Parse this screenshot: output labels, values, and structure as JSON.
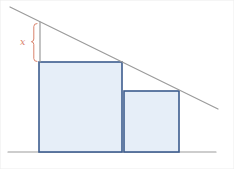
{
  "diagram": {
    "label_x": "x",
    "colors": {
      "background": "#ffffff",
      "frame": "#ececec",
      "line_gray": "#9b9b9b",
      "square_stroke": "#3d5c8e",
      "square_fill": "#e6eef8",
      "accent_orange": "#d9826b"
    },
    "geometry": {
      "canvas": {
        "width": 234,
        "height": 169
      },
      "hypotenuse": {
        "x1": 10,
        "y1": 7,
        "x2": 218,
        "y2": 109
      },
      "base_line": {
        "x1": 8,
        "y1": 152,
        "x2": 216,
        "y2": 152
      },
      "x_segment": {
        "x1": 40,
        "y1": 22,
        "x2": 40,
        "y2": 62
      },
      "large_square": {
        "x": 39,
        "y": 62,
        "w": 83,
        "h": 90
      },
      "small_square": {
        "x": 124,
        "y": 91,
        "w": 55,
        "h": 61
      },
      "brace_path": "M37,23.5 Q33.8,23.5 33.8,26.5 L33.8,39 Q33.8,41.5 31.4,41.7 Q33.8,41.9 33.8,44.5 L33.8,58.5 Q33.8,61.5 37,61.5",
      "x_label_pos": {
        "x": 20,
        "y": 45
      }
    }
  }
}
